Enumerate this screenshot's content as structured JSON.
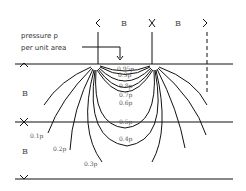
{
  "diagram": {
    "annotation": {
      "line1": "pressure p",
      "line2": "per unit area"
    },
    "dimension_labels": {
      "top_left": "B",
      "top_right": "B",
      "side_top": "B",
      "side_bottom": "B"
    },
    "contours": [
      {
        "label": "0.95p"
      },
      {
        "label": "0.9p"
      },
      {
        "label": "0.8p"
      },
      {
        "label": "0.7p"
      },
      {
        "label": "0.6p"
      },
      {
        "label": "0.5p"
      },
      {
        "label": "0.4p"
      },
      {
        "label": "0.3p"
      },
      {
        "label": "0.2p"
      },
      {
        "label": "0.1p"
      }
    ]
  }
}
